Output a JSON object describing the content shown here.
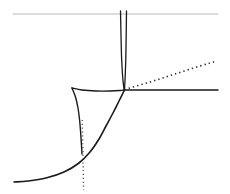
{
  "figure": {
    "title": "",
    "background_color": "#ffffff",
    "width": 230,
    "height": 194
  },
  "chart_data": {
    "type": "line",
    "title": "",
    "subtitle": "",
    "xlabel": "",
    "ylabel": "",
    "xlim": [
      0,
      230
    ],
    "ylim": [
      194,
      0
    ],
    "grid": false,
    "legend": null,
    "axes_visible": false,
    "tick_labels": {
      "x": [],
      "y": []
    },
    "annotations": [],
    "colors": {
      "curve_solid": "#1a1a1a",
      "curve_dotted": "#2b2b2b",
      "guide_line": "#b8b8b8",
      "background": "#ffffff"
    },
    "series": [
      {
        "name": "upper-guide-line",
        "style": "solid",
        "color": "#b8b8b8",
        "width": 1.2,
        "points": [
          [
            13,
            14
          ],
          [
            218,
            14
          ]
        ]
      },
      {
        "name": "left-vertical-branch",
        "style": "solid",
        "color": "#1a1a1a",
        "width": 1.3,
        "points": [
          [
            120.5,
            11
          ],
          [
            121.0,
            35
          ],
          [
            121.6,
            58
          ],
          [
            122.6,
            76
          ],
          [
            123.6,
            86
          ],
          [
            124.2,
            90
          ]
        ]
      },
      {
        "name": "right-vertical-branch",
        "style": "solid",
        "color": "#1a1a1a",
        "width": 1.3,
        "points": [
          [
            126.5,
            11
          ],
          [
            126.2,
            35
          ],
          [
            125.8,
            58
          ],
          [
            125.2,
            76
          ],
          [
            124.7,
            86
          ],
          [
            124.3,
            90
          ]
        ]
      },
      {
        "name": "dotted-upper-right-ray",
        "style": "dotted",
        "color": "#2b2b2b",
        "width": 1.6,
        "points": [
          [
            124.5,
            89.5
          ],
          [
            150,
            82
          ],
          [
            175,
            74
          ],
          [
            200,
            66
          ],
          [
            217,
            61
          ]
        ]
      },
      {
        "name": "horizontal-right-ray",
        "style": "solid",
        "color": "#1a1a1a",
        "width": 1.5,
        "points": [
          [
            124.5,
            90
          ],
          [
            160,
            90
          ],
          [
            190,
            90
          ],
          [
            218,
            90
          ]
        ]
      },
      {
        "name": "cup-top-arc",
        "style": "solid",
        "color": "#1a1a1a",
        "width": 1.4,
        "points": [
          [
            72,
            88
          ],
          [
            82,
            90
          ],
          [
            96,
            91
          ],
          [
            110,
            91
          ],
          [
            120,
            90.5
          ],
          [
            124.5,
            90
          ]
        ]
      },
      {
        "name": "cup-left-branch",
        "style": "solid",
        "color": "#1a1a1a",
        "width": 1.4,
        "points": [
          [
            72,
            88
          ],
          [
            75.5,
            97
          ],
          [
            78.0,
            108
          ],
          [
            79.6,
            120
          ],
          [
            80.6,
            132
          ],
          [
            81.4,
            144
          ],
          [
            82.0,
            154
          ]
        ]
      },
      {
        "name": "dotted-vertical-descender",
        "style": "dotted",
        "color": "#5a5a5a",
        "width": 1.4,
        "points": [
          [
            82.2,
            120
          ],
          [
            82.8,
            145
          ],
          [
            83.2,
            168
          ],
          [
            83.6,
            190
          ]
        ]
      },
      {
        "name": "main-descending-curve",
        "style": "solid",
        "color": "#1a1a1a",
        "width": 1.6,
        "points": [
          [
            124.5,
            90
          ],
          [
            119,
            101
          ],
          [
            113,
            113
          ],
          [
            106,
            126
          ],
          [
            99,
            139
          ],
          [
            90,
            152
          ],
          [
            79,
            163
          ],
          [
            64,
            172
          ],
          [
            46,
            178
          ],
          [
            28,
            181
          ],
          [
            14,
            182
          ]
        ]
      }
    ]
  }
}
